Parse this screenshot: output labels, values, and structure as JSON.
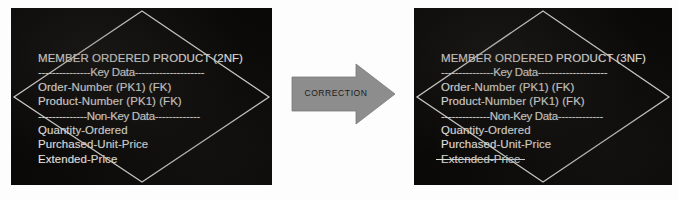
{
  "figure": {
    "background_color": "#fdfdfd",
    "panel_color": "#0a0908",
    "text_color": "#e9e9e6",
    "arrow_color": "#8d8d8d",
    "arrow_label_color": "#1b1b1b"
  },
  "left_panel": {
    "name": "before-entity-panel",
    "shape": "diamond",
    "entity": {
      "title": "MEMBER ORDERED PRODUCT (2NF)",
      "key_data_separator": "---------------Key Data--------------------",
      "key_attributes": [
        "Order-Number (PK1) (FK)",
        "Product-Number (PK1) (FK)"
      ],
      "non_key_data_separator": "--------------Non-Key Data-------------",
      "non_key_attributes": [
        {
          "label": "Quantity-Ordered",
          "struck": false
        },
        {
          "label": "Purchased-Unit-Price",
          "struck": false
        },
        {
          "label": "Extended-Price",
          "struck": false
        }
      ]
    }
  },
  "arrow": {
    "name": "correction-arrow",
    "label": "CORRECTION",
    "direction": "right"
  },
  "right_panel": {
    "name": "after-entity-panel",
    "shape": "diamond",
    "entity": {
      "title": "MEMBER ORDERED PRODUCT (3NF)",
      "key_data_separator": "---------------Key Data--------------------",
      "key_attributes": [
        "Order-Number (PK1) (FK)",
        "Product-Number (PK1) (FK)"
      ],
      "non_key_data_separator": "--------------Non-Key Data-------------",
      "non_key_attributes": [
        {
          "label": "Quantity-Ordered",
          "struck": false
        },
        {
          "label": "Purchased-Unit-Price",
          "struck": false
        },
        {
          "label": "Extended-Price",
          "struck": true
        }
      ]
    }
  }
}
